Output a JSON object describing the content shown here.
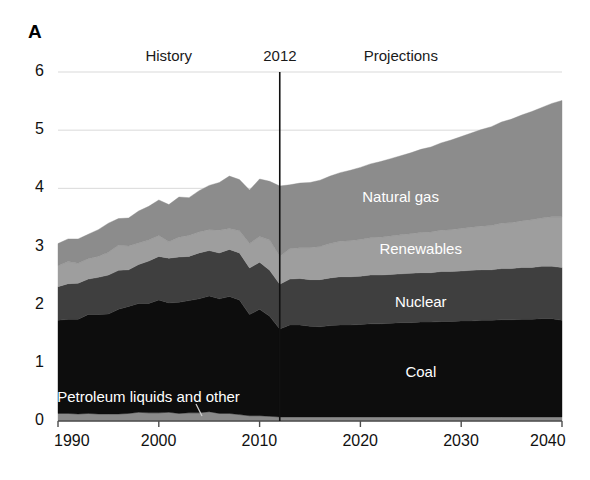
{
  "panel": {
    "label": "A"
  },
  "annotations": {
    "history": "History",
    "divider_year": "2012",
    "projections": "Projections"
  },
  "colors": {
    "natural_gas": "#8c8c8c",
    "renewables": "#9e9e9e",
    "nuclear": "#3f3f3f",
    "coal": "#0d0d0d",
    "petroleum": "#8a8a8a",
    "gridline": "#d9d9d9",
    "axis": "#4d4d4d",
    "divider": "#111111",
    "background": "#ffffff",
    "series_label_text": "#ffffff"
  },
  "chart_data": {
    "type": "area",
    "title": "",
    "subtitle": "",
    "xlabel": "",
    "ylabel": "",
    "xlim": [
      1990,
      2040
    ],
    "ylim": [
      0,
      6
    ],
    "grid": true,
    "legend_position": "inline-labels",
    "stacked": true,
    "xticks": [
      1990,
      2000,
      2010,
      2020,
      2030,
      2040
    ],
    "xtick_labels": [
      "1990",
      "2000",
      "2010",
      "2020",
      "2030",
      "2040"
    ],
    "yticks": [
      0,
      1,
      2,
      3,
      4,
      5,
      6
    ],
    "ytick_labels": [
      "0",
      "1",
      "2",
      "3",
      "4",
      "5",
      "6"
    ],
    "divider_x": 2012,
    "annotations": [
      {
        "text": "History",
        "x": 2001,
        "y": 6.0
      },
      {
        "text": "2012",
        "x": 2012,
        "y": 6.0
      },
      {
        "text": "Projections",
        "x": 2024,
        "y": 6.0
      }
    ],
    "x": [
      1990,
      1991,
      1992,
      1993,
      1994,
      1995,
      1996,
      1997,
      1998,
      1999,
      2000,
      2001,
      2002,
      2003,
      2004,
      2005,
      2006,
      2007,
      2008,
      2009,
      2010,
      2011,
      2012,
      2013,
      2014,
      2015,
      2016,
      2017,
      2018,
      2019,
      2020,
      2021,
      2022,
      2023,
      2024,
      2025,
      2026,
      2027,
      2028,
      2029,
      2030,
      2031,
      2032,
      2033,
      2034,
      2035,
      2036,
      2037,
      2038,
      2039,
      2040
    ],
    "series": [
      {
        "name": "Petroleum liquids and other",
        "label_text": "Petroleum liquids and other",
        "color": "#8a8a8a",
        "label_x": 1999,
        "label_y": 0.42,
        "values": [
          0.13,
          0.13,
          0.12,
          0.13,
          0.12,
          0.12,
          0.12,
          0.13,
          0.15,
          0.14,
          0.14,
          0.15,
          0.13,
          0.14,
          0.14,
          0.16,
          0.13,
          0.13,
          0.11,
          0.09,
          0.09,
          0.08,
          0.07,
          0.07,
          0.07,
          0.07,
          0.07,
          0.07,
          0.07,
          0.07,
          0.07,
          0.07,
          0.07,
          0.07,
          0.07,
          0.07,
          0.07,
          0.07,
          0.07,
          0.07,
          0.07,
          0.07,
          0.07,
          0.07,
          0.07,
          0.07,
          0.07,
          0.07,
          0.07,
          0.07,
          0.07
        ]
      },
      {
        "name": "Coal",
        "label_text": "Coal",
        "color": "#0d0d0d",
        "label_x": 2026,
        "label_y": 0.85,
        "values": [
          1.6,
          1.62,
          1.63,
          1.7,
          1.71,
          1.72,
          1.8,
          1.84,
          1.87,
          1.88,
          1.94,
          1.88,
          1.91,
          1.93,
          1.96,
          1.99,
          1.97,
          2.01,
          1.97,
          1.74,
          1.83,
          1.72,
          1.51,
          1.58,
          1.58,
          1.56,
          1.55,
          1.57,
          1.58,
          1.58,
          1.59,
          1.6,
          1.6,
          1.61,
          1.62,
          1.62,
          1.63,
          1.63,
          1.64,
          1.64,
          1.65,
          1.65,
          1.66,
          1.66,
          1.67,
          1.67,
          1.68,
          1.68,
          1.69,
          1.69,
          1.66
        ]
      },
      {
        "name": "Nuclear",
        "label_text": "Nuclear",
        "color": "#3f3f3f",
        "label_x": 2026,
        "label_y": 2.05,
        "values": [
          0.58,
          0.61,
          0.62,
          0.61,
          0.64,
          0.67,
          0.67,
          0.63,
          0.67,
          0.73,
          0.75,
          0.77,
          0.78,
          0.76,
          0.79,
          0.78,
          0.79,
          0.81,
          0.81,
          0.8,
          0.81,
          0.79,
          0.77,
          0.79,
          0.8,
          0.8,
          0.81,
          0.82,
          0.83,
          0.83,
          0.83,
          0.84,
          0.84,
          0.84,
          0.84,
          0.85,
          0.85,
          0.85,
          0.86,
          0.86,
          0.86,
          0.87,
          0.87,
          0.87,
          0.88,
          0.88,
          0.89,
          0.89,
          0.9,
          0.9,
          0.91
        ]
      },
      {
        "name": "Renewables",
        "label_text": "Renewables",
        "color": "#9e9e9e",
        "label_x": 2026,
        "label_y": 2.95,
        "values": [
          0.36,
          0.38,
          0.34,
          0.35,
          0.36,
          0.39,
          0.43,
          0.41,
          0.37,
          0.36,
          0.36,
          0.28,
          0.34,
          0.36,
          0.36,
          0.36,
          0.39,
          0.36,
          0.38,
          0.42,
          0.44,
          0.52,
          0.48,
          0.52,
          0.53,
          0.55,
          0.57,
          0.59,
          0.61,
          0.62,
          0.63,
          0.64,
          0.65,
          0.66,
          0.67,
          0.68,
          0.69,
          0.7,
          0.71,
          0.72,
          0.73,
          0.74,
          0.75,
          0.76,
          0.78,
          0.79,
          0.8,
          0.82,
          0.83,
          0.85,
          0.87
        ]
      },
      {
        "name": "Natural gas",
        "label_text": "Natural gas",
        "color": "#8c8c8c",
        "label_x": 2024,
        "label_y": 3.85,
        "values": [
          0.38,
          0.39,
          0.42,
          0.42,
          0.46,
          0.5,
          0.46,
          0.48,
          0.55,
          0.58,
          0.61,
          0.64,
          0.69,
          0.65,
          0.71,
          0.76,
          0.82,
          0.9,
          0.88,
          0.92,
          0.99,
          1.01,
          1.21,
          1.1,
          1.11,
          1.12,
          1.14,
          1.16,
          1.18,
          1.21,
          1.24,
          1.27,
          1.3,
          1.33,
          1.36,
          1.39,
          1.43,
          1.46,
          1.5,
          1.54,
          1.58,
          1.62,
          1.66,
          1.7,
          1.74,
          1.78,
          1.82,
          1.86,
          1.9,
          1.95,
          2.0
        ]
      }
    ],
    "totals_note": "",
    "stack_order_bottom_to_top": [
      "Petroleum liquids and other",
      "Coal",
      "Nuclear",
      "Renewables",
      "Natural gas"
    ]
  }
}
